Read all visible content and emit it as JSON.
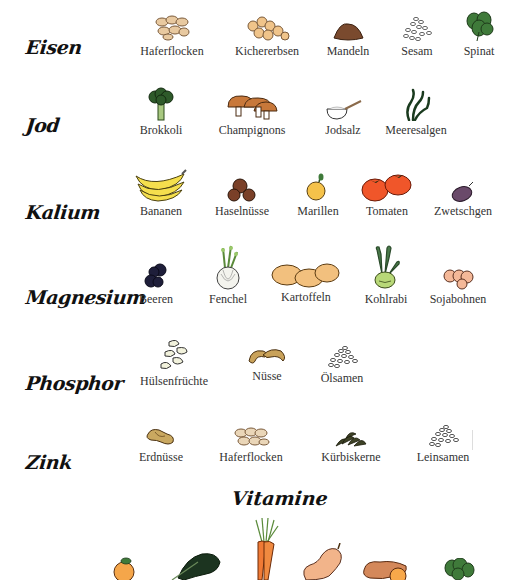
{
  "categories": [
    {
      "name": "Eisen",
      "items": [
        "Haferflocken",
        "Kichererbsen",
        "Mandeln",
        "Sesam",
        "Spinat"
      ]
    },
    {
      "name": "Jod",
      "items": [
        "Brokkoli",
        "Champignons",
        "Jodsalz",
        "Meeresalgen"
      ]
    },
    {
      "name": "Kalium",
      "items": [
        "Bananen",
        "Haselnüsse",
        "Marillen",
        "Tomaten",
        "Zwetschgen"
      ]
    },
    {
      "name": "Magnesium",
      "items": [
        "Beeren",
        "Fenchel",
        "Kartoffeln",
        "Kohlrabi",
        "Sojabohnen"
      ]
    },
    {
      "name": "Phosphor",
      "items": [
        "Hülsenfrüchte",
        "Nüsse",
        "Ölsamen"
      ]
    },
    {
      "name": "Zink",
      "items": [
        "Erdnüsse",
        "Haferflocken",
        "Kürbiskerne",
        "Leinsamen"
      ]
    }
  ],
  "vitamins": {
    "title": "Vitamine",
    "icons": [
      "apricot-icon",
      "kale-icon",
      "carrot-icon",
      "butternut-squash-icon",
      "sweet-potato-icon",
      "spinach-icon"
    ]
  },
  "colors": {
    "oat": "#e8c9a0",
    "chickpea": "#f0c48a",
    "almond": "#7a4a2e",
    "spinach": "#3f7a3a",
    "banana": "#f5df4d",
    "tomato": "#f0562a",
    "plum": "#6a4a6a",
    "berry": "#1e1e3a",
    "potato": "#f2c07e",
    "kohlrabi": "#b8d878",
    "carrot": "#f07a35"
  }
}
